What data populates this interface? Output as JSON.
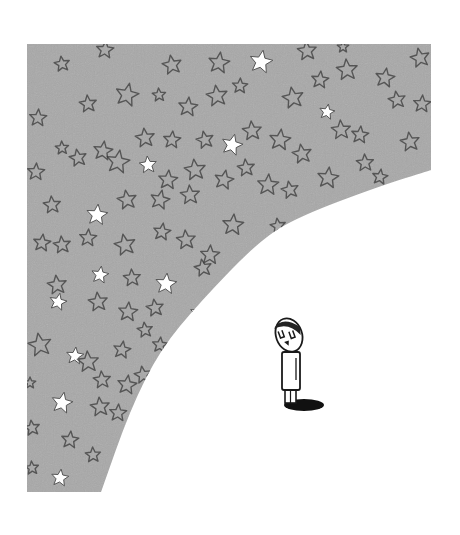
{
  "illustration": {
    "description": "A small cartoon person standing alone looking up at a vast star-filled sky that curves away above him",
    "colors": {
      "background": "#ffffff",
      "sky": "#a8a8a8",
      "star_stroke": "#3a3a3a",
      "star_fill_bright": "#ffffff",
      "figure_outline": "#1a1a1a",
      "shadow": "#111111"
    },
    "sky_shape": {
      "left": 27,
      "top": 44,
      "right": 431,
      "bottom": 492,
      "curve_points": [
        [
          431,
          170
        ],
        [
          380,
          186
        ],
        [
          300,
          216
        ],
        [
          260,
          240
        ],
        [
          200,
          302
        ],
        [
          160,
          350
        ],
        [
          130,
          410
        ],
        [
          101,
          492
        ]
      ]
    },
    "stars": [
      {
        "x": 62,
        "y": 64,
        "r": 8,
        "bright": false,
        "rot": -8
      },
      {
        "x": 105,
        "y": 50,
        "r": 9,
        "bright": false,
        "rot": 5
      },
      {
        "x": 172,
        "y": 65,
        "r": 10,
        "bright": false,
        "rot": -10
      },
      {
        "x": 219,
        "y": 63,
        "r": 11,
        "bright": false,
        "rot": 8
      },
      {
        "x": 261,
        "y": 62,
        "r": 12,
        "bright": true,
        "rot": 10
      },
      {
        "x": 307,
        "y": 51,
        "r": 10,
        "bright": false,
        "rot": -5
      },
      {
        "x": 343,
        "y": 47,
        "r": 6,
        "bright": false,
        "rot": 0
      },
      {
        "x": 420,
        "y": 58,
        "r": 10,
        "bright": false,
        "rot": -12
      },
      {
        "x": 38,
        "y": 118,
        "r": 9,
        "bright": false,
        "rot": 4
      },
      {
        "x": 88,
        "y": 104,
        "r": 9,
        "bright": false,
        "rot": -6
      },
      {
        "x": 127,
        "y": 95,
        "r": 12,
        "bright": false,
        "rot": 12
      },
      {
        "x": 159,
        "y": 95,
        "r": 7,
        "bright": false,
        "rot": -4
      },
      {
        "x": 188,
        "y": 107,
        "r": 10,
        "bright": false,
        "rot": 6
      },
      {
        "x": 217,
        "y": 96,
        "r": 11,
        "bright": false,
        "rot": -8
      },
      {
        "x": 240,
        "y": 86,
        "r": 8,
        "bright": false,
        "rot": 3
      },
      {
        "x": 293,
        "y": 98,
        "r": 11,
        "bright": false,
        "rot": -10
      },
      {
        "x": 320,
        "y": 80,
        "r": 9,
        "bright": false,
        "rot": 6
      },
      {
        "x": 347,
        "y": 70,
        "r": 11,
        "bright": false,
        "rot": -5
      },
      {
        "x": 385,
        "y": 78,
        "r": 10,
        "bright": false,
        "rot": 9
      },
      {
        "x": 397,
        "y": 100,
        "r": 9,
        "bright": false,
        "rot": -9
      },
      {
        "x": 422,
        "y": 104,
        "r": 9,
        "bright": false,
        "rot": 4
      },
      {
        "x": 62,
        "y": 148,
        "r": 7,
        "bright": false,
        "rot": -3
      },
      {
        "x": 103,
        "y": 151,
        "r": 10,
        "bright": false,
        "rot": 8
      },
      {
        "x": 145,
        "y": 138,
        "r": 10,
        "bright": false,
        "rot": -7
      },
      {
        "x": 172,
        "y": 140,
        "r": 9,
        "bright": false,
        "rot": 5
      },
      {
        "x": 205,
        "y": 140,
        "r": 9,
        "bright": false,
        "rot": -12
      },
      {
        "x": 232,
        "y": 145,
        "r": 11,
        "bright": true,
        "rot": 14
      },
      {
        "x": 252,
        "y": 131,
        "r": 10,
        "bright": false,
        "rot": -5
      },
      {
        "x": 280,
        "y": 140,
        "r": 11,
        "bright": false,
        "rot": 7
      },
      {
        "x": 302,
        "y": 154,
        "r": 10,
        "bright": false,
        "rot": -9
      },
      {
        "x": 327,
        "y": 112,
        "r": 8,
        "bright": true,
        "rot": 10
      },
      {
        "x": 341,
        "y": 130,
        "r": 10,
        "bright": false,
        "rot": -4
      },
      {
        "x": 360,
        "y": 135,
        "r": 9,
        "bright": false,
        "rot": 6
      },
      {
        "x": 410,
        "y": 142,
        "r": 10,
        "bright": false,
        "rot": -8
      },
      {
        "x": 36,
        "y": 172,
        "r": 9,
        "bright": false,
        "rot": 3
      },
      {
        "x": 78,
        "y": 158,
        "r": 9,
        "bright": false,
        "rot": -10
      },
      {
        "x": 118,
        "y": 162,
        "r": 12,
        "bright": false,
        "rot": 9
      },
      {
        "x": 148,
        "y": 165,
        "r": 9,
        "bright": true,
        "rot": -5
      },
      {
        "x": 168,
        "y": 180,
        "r": 10,
        "bright": false,
        "rot": 5
      },
      {
        "x": 195,
        "y": 170,
        "r": 11,
        "bright": false,
        "rot": -7
      },
      {
        "x": 224,
        "y": 180,
        "r": 10,
        "bright": false,
        "rot": 11
      },
      {
        "x": 246,
        "y": 168,
        "r": 9,
        "bright": false,
        "rot": -6
      },
      {
        "x": 268,
        "y": 185,
        "r": 11,
        "bright": false,
        "rot": 4
      },
      {
        "x": 290,
        "y": 190,
        "r": 9,
        "bright": false,
        "rot": -11
      },
      {
        "x": 328,
        "y": 178,
        "r": 11,
        "bright": false,
        "rot": 7
      },
      {
        "x": 365,
        "y": 163,
        "r": 9,
        "bright": false,
        "rot": -3
      },
      {
        "x": 380,
        "y": 177,
        "r": 8,
        "bright": false,
        "rot": 8
      },
      {
        "x": 52,
        "y": 205,
        "r": 9,
        "bright": false,
        "rot": -5
      },
      {
        "x": 97,
        "y": 215,
        "r": 11,
        "bright": true,
        "rot": 6
      },
      {
        "x": 127,
        "y": 200,
        "r": 10,
        "bright": false,
        "rot": -9
      },
      {
        "x": 160,
        "y": 200,
        "r": 10,
        "bright": false,
        "rot": 12
      },
      {
        "x": 190,
        "y": 195,
        "r": 10,
        "bright": false,
        "rot": -4
      },
      {
        "x": 233,
        "y": 225,
        "r": 11,
        "bright": false,
        "rot": 5
      },
      {
        "x": 278,
        "y": 226,
        "r": 8,
        "bright": false,
        "rot": -8
      },
      {
        "x": 42,
        "y": 243,
        "r": 9,
        "bright": false,
        "rot": 7
      },
      {
        "x": 62,
        "y": 245,
        "r": 9,
        "bright": false,
        "rot": -6
      },
      {
        "x": 88,
        "y": 238,
        "r": 9,
        "bright": false,
        "rot": 4
      },
      {
        "x": 125,
        "y": 245,
        "r": 11,
        "bright": false,
        "rot": -11
      },
      {
        "x": 162,
        "y": 232,
        "r": 9,
        "bright": false,
        "rot": 8
      },
      {
        "x": 186,
        "y": 240,
        "r": 10,
        "bright": false,
        "rot": -5
      },
      {
        "x": 210,
        "y": 255,
        "r": 10,
        "bright": false,
        "rot": 3
      },
      {
        "x": 57,
        "y": 285,
        "r": 10,
        "bright": false,
        "rot": -7
      },
      {
        "x": 100,
        "y": 275,
        "r": 9,
        "bright": true,
        "rot": 9
      },
      {
        "x": 132,
        "y": 278,
        "r": 9,
        "bright": false,
        "rot": -4
      },
      {
        "x": 166,
        "y": 284,
        "r": 11,
        "bright": true,
        "rot": 6
      },
      {
        "x": 203,
        "y": 268,
        "r": 9,
        "bright": false,
        "rot": -10
      },
      {
        "x": 58,
        "y": 302,
        "r": 9,
        "bright": true,
        "rot": 12
      },
      {
        "x": 98,
        "y": 302,
        "r": 10,
        "bright": false,
        "rot": -6
      },
      {
        "x": 128,
        "y": 312,
        "r": 10,
        "bright": false,
        "rot": 5
      },
      {
        "x": 155,
        "y": 308,
        "r": 9,
        "bright": false,
        "rot": -8
      },
      {
        "x": 198,
        "y": 313,
        "r": 8,
        "bright": true,
        "rot": 7
      },
      {
        "x": 40,
        "y": 345,
        "r": 12,
        "bright": false,
        "rot": -10
      },
      {
        "x": 75,
        "y": 356,
        "r": 9,
        "bright": true,
        "rot": 6
      },
      {
        "x": 88,
        "y": 362,
        "r": 11,
        "bright": false,
        "rot": -4
      },
      {
        "x": 122,
        "y": 350,
        "r": 9,
        "bright": false,
        "rot": 9
      },
      {
        "x": 145,
        "y": 330,
        "r": 8,
        "bright": false,
        "rot": -7
      },
      {
        "x": 160,
        "y": 345,
        "r": 8,
        "bright": false,
        "rot": 5
      },
      {
        "x": 102,
        "y": 380,
        "r": 9,
        "bright": false,
        "rot": -5
      },
      {
        "x": 127,
        "y": 385,
        "r": 10,
        "bright": false,
        "rot": 8
      },
      {
        "x": 143,
        "y": 375,
        "r": 9,
        "bright": false,
        "rot": -9
      },
      {
        "x": 30,
        "y": 383,
        "r": 6,
        "bright": false,
        "rot": 0
      },
      {
        "x": 62,
        "y": 403,
        "r": 11,
        "bright": true,
        "rot": 11
      },
      {
        "x": 100,
        "y": 407,
        "r": 10,
        "bright": false,
        "rot": -6
      },
      {
        "x": 118,
        "y": 413,
        "r": 9,
        "bright": false,
        "rot": 4
      },
      {
        "x": 32,
        "y": 428,
        "r": 8,
        "bright": false,
        "rot": -8
      },
      {
        "x": 70,
        "y": 440,
        "r": 9,
        "bright": false,
        "rot": 6
      },
      {
        "x": 93,
        "y": 455,
        "r": 8,
        "bright": false,
        "rot": -3
      },
      {
        "x": 60,
        "y": 478,
        "r": 9,
        "bright": true,
        "rot": 7
      },
      {
        "x": 32,
        "y": 468,
        "r": 7,
        "bright": false,
        "rot": -5
      }
    ],
    "figure": {
      "label": "small person looking up at the stars",
      "head": {
        "cx": 289,
        "cy": 335,
        "rx": 13,
        "ry": 17,
        "tilt": -20
      },
      "body": {
        "x": 282,
        "y": 352,
        "w": 18,
        "h": 38
      },
      "legs": {
        "x": 285,
        "y": 389,
        "w": 11,
        "h": 14
      },
      "shadow": {
        "cx": 304,
        "cy": 405,
        "rx": 20,
        "ry": 6
      }
    }
  }
}
